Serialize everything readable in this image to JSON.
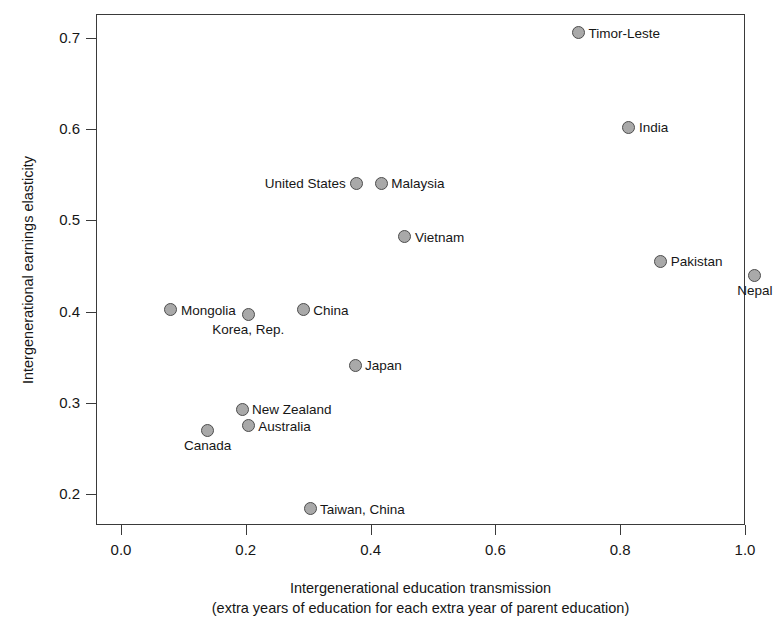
{
  "chart_data": {
    "type": "scatter",
    "title": "",
    "xlabel": "Intergenerational education transmission",
    "xlabel_sub": "(extra years of education for each extra year of parent education)",
    "ylabel": "Intergenerational earnings elasticity",
    "xlim": [
      -0.04,
      1.04
    ],
    "ylim": [
      0.165,
      0.735
    ],
    "xticks": [
      "0.0",
      "0.2",
      "0.4",
      "0.6",
      "0.8",
      "1.0"
    ],
    "xtick_values": [
      0.0,
      0.2,
      0.4,
      0.6,
      0.8,
      1.0
    ],
    "yticks": [
      "0.2",
      "0.3",
      "0.4",
      "0.5",
      "0.6",
      "0.7"
    ],
    "ytick_values": [
      0.2,
      0.3,
      0.4,
      0.5,
      0.6,
      0.7
    ],
    "grid": false,
    "legend": "none",
    "marker_fill": "#a9a9a9",
    "marker_edge": "#4d4d4d",
    "points": [
      {
        "label": "Timor-Leste",
        "x": 0.733,
        "y": 0.706,
        "label_pos": "right"
      },
      {
        "label": "India",
        "x": 0.814,
        "y": 0.602,
        "label_pos": "right"
      },
      {
        "label": "United States",
        "x": 0.378,
        "y": 0.541,
        "label_pos": "left"
      },
      {
        "label": "Malaysia",
        "x": 0.417,
        "y": 0.541,
        "label_pos": "right"
      },
      {
        "label": "Vietnam",
        "x": 0.455,
        "y": 0.482,
        "label_pos": "right"
      },
      {
        "label": "Pakistan",
        "x": 0.865,
        "y": 0.455,
        "label_pos": "right"
      },
      {
        "label": "Nepal",
        "x": 1.016,
        "y": 0.44,
        "label_pos": "below"
      },
      {
        "label": "Mongolia",
        "x": 0.08,
        "y": 0.402,
        "label_pos": "right"
      },
      {
        "label": "China",
        "x": 0.292,
        "y": 0.402,
        "label_pos": "right"
      },
      {
        "label": "Korea, Rep.",
        "x": 0.204,
        "y": 0.397,
        "label_pos": "below"
      },
      {
        "label": "Japan",
        "x": 0.375,
        "y": 0.341,
        "label_pos": "right"
      },
      {
        "label": "New Zealand",
        "x": 0.194,
        "y": 0.293,
        "label_pos": "right"
      },
      {
        "label": "Australia",
        "x": 0.204,
        "y": 0.275,
        "label_pos": "right"
      },
      {
        "label": "Canada",
        "x": 0.139,
        "y": 0.27,
        "label_pos": "below"
      },
      {
        "label": "Taiwan, China",
        "x": 0.303,
        "y": 0.184,
        "label_pos": "right"
      }
    ]
  }
}
